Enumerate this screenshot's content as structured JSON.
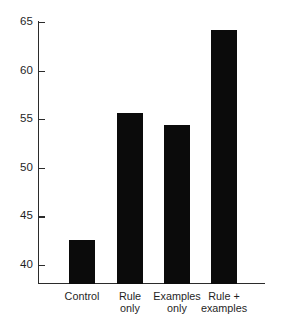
{
  "chart_data": {
    "type": "bar",
    "title": "",
    "subtitle": "",
    "xlabel": "",
    "ylabel": "",
    "categories": [
      "Control",
      "Rule only",
      "Examples only",
      "Rule + examples"
    ],
    "category_lines": [
      [
        "Control"
      ],
      [
        "Rule",
        "only"
      ],
      [
        "Examples",
        "only"
      ],
      [
        "Rule +",
        "examples"
      ]
    ],
    "values": [
      42.6,
      55.6,
      54.4,
      64.2
    ],
    "ylim": [
      38.0,
      65.0
    ],
    "yticks": [
      40,
      45,
      50,
      55,
      60,
      65
    ],
    "ytick_labels": [
      "40",
      "45",
      "50",
      "55",
      "60",
      "65"
    ],
    "grid": false,
    "legend": "none",
    "bar_color": "#0b0b0b",
    "axis_color": "#2b2b2b",
    "background": "#ffffff"
  }
}
